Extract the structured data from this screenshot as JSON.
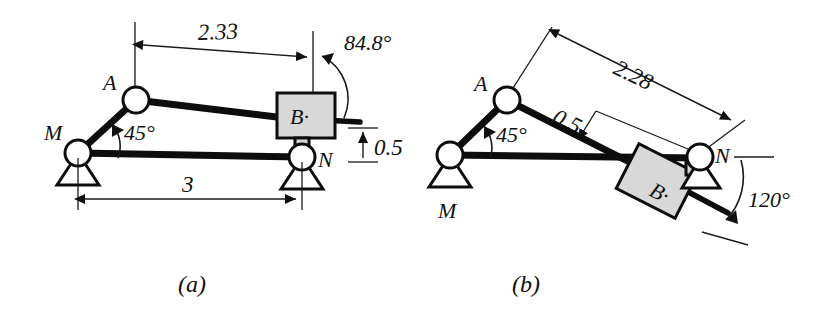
{
  "figure": {
    "background_color": "#ffffff",
    "line_color": "#0d0d0d",
    "block_fill_color": "#d8d8d8"
  },
  "panels": [
    {
      "id": "panel-a",
      "caption": "(a)",
      "joints": [
        {
          "name": "M",
          "label": "M",
          "type": "pin-support"
        },
        {
          "name": "A",
          "label": "A",
          "type": "pin-joint"
        },
        {
          "name": "B",
          "label": "B·",
          "type": "slider-block"
        },
        {
          "name": "N",
          "label": "N",
          "type": "pin-support"
        }
      ],
      "dimensions": [
        {
          "name": "dim-2-33",
          "value": "2.33"
        },
        {
          "name": "dim-3",
          "value": "3"
        },
        {
          "name": "dim-0-5",
          "value": "0.5"
        }
      ],
      "angles": [
        {
          "name": "angle-45",
          "value": "45°"
        },
        {
          "name": "angle-84-8",
          "value": "84.8°"
        }
      ]
    },
    {
      "id": "panel-b",
      "caption": "(b)",
      "joints": [
        {
          "name": "M",
          "label": "M",
          "type": "pin-support"
        },
        {
          "name": "A",
          "label": "A",
          "type": "pin-joint"
        },
        {
          "name": "B",
          "label": "B·",
          "type": "slider-block"
        },
        {
          "name": "N",
          "label": "N",
          "type": "pin-support"
        }
      ],
      "dimensions": [
        {
          "name": "dim-2-28",
          "value": "2.28"
        },
        {
          "name": "dim-0-5",
          "value": "0.5"
        }
      ],
      "angles": [
        {
          "name": "angle-45",
          "value": "45°"
        },
        {
          "name": "angle-120",
          "value": "120°"
        }
      ]
    }
  ]
}
